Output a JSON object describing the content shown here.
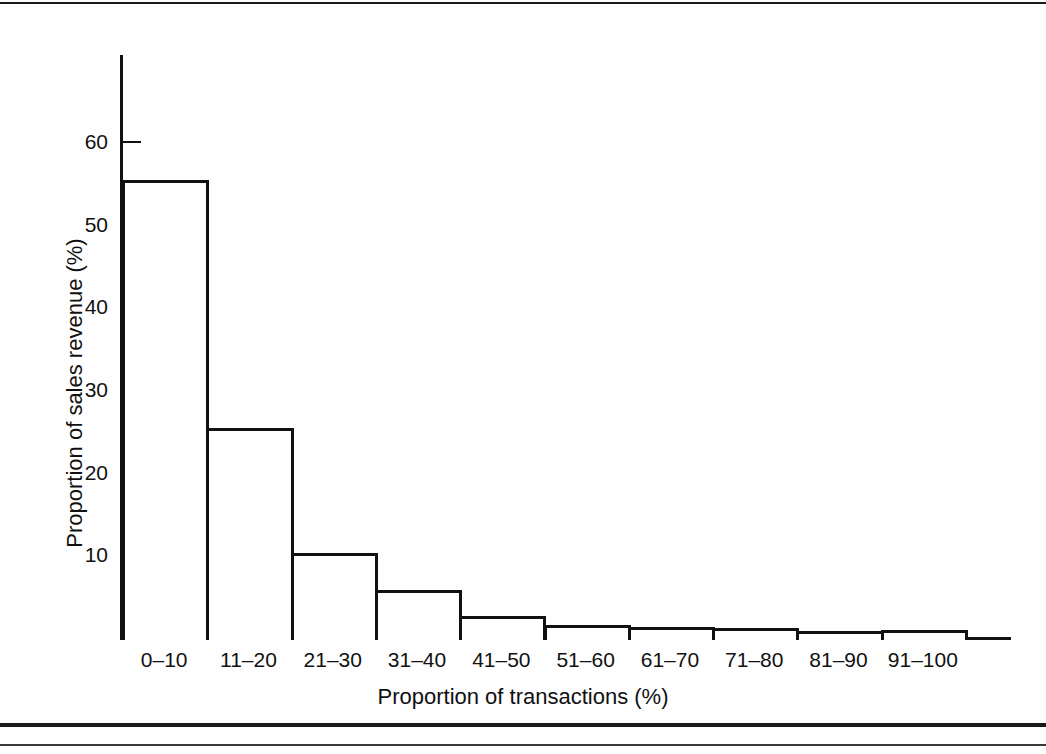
{
  "figure": {
    "background_color": "#fefefe",
    "ink_color": "#111111"
  },
  "chart_data": {
    "type": "bar",
    "title": "",
    "subtitle": "",
    "xlabel": "Proportion of transactions (%)",
    "ylabel": "Proportion of sales revenue (%)",
    "categories": [
      "0–10",
      "11–20",
      "21–30",
      "31–40",
      "41–50",
      "51–60",
      "61–70",
      "71–80",
      "81–90",
      "91–100"
    ],
    "values": [
      55.4,
      25.4,
      10.3,
      5.8,
      2.7,
      1.6,
      1.3,
      1.2,
      0.9,
      1.0
    ],
    "ylim": [
      0,
      70
    ],
    "xlim": [
      0,
      10
    ],
    "y_ticks": [
      10,
      20,
      30,
      40,
      50,
      60
    ],
    "y_tick_labels": [
      "10",
      "20",
      "30",
      "40",
      "50",
      "60"
    ],
    "grid": false,
    "legend": null,
    "legend_position": "none",
    "bar_style": "outline",
    "bar_fill": "#ffffff",
    "bar_edge": "#111111",
    "annotations": []
  },
  "axes": {
    "y_title": "Proportion of sales revenue (%)",
    "x_title": "Proportion of transactions (%)"
  },
  "rules": {
    "top": "horizontal-rule",
    "bottom_thick": "horizontal-rule",
    "bottom_thin": "horizontal-rule"
  }
}
